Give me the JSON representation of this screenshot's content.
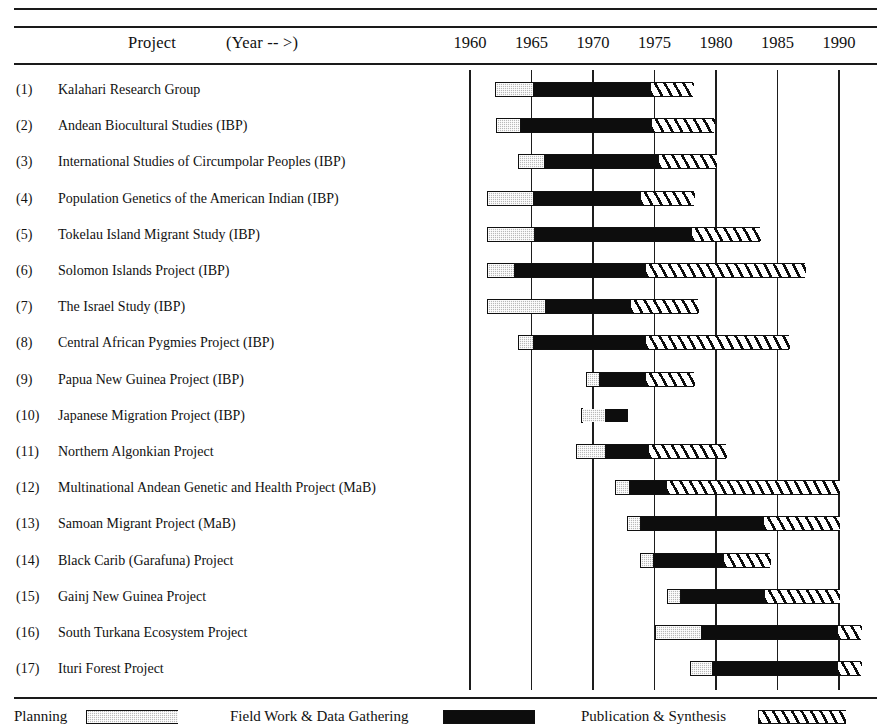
{
  "header": {
    "project_label": "Project",
    "year_label": "(Year -- >)",
    "year_ticks": [
      1960,
      1965,
      1970,
      1975,
      1980,
      1985,
      1990
    ]
  },
  "legend": {
    "items": [
      {
        "label": "Planning",
        "swatch": "planning",
        "color": "#b9b9b9"
      },
      {
        "label": "Field Work & Data Gathering",
        "swatch": "fieldwork",
        "color": "#0d0d0d"
      },
      {
        "label": "Publication & Synthesis",
        "swatch": "publication",
        "color": "#ffffff"
      }
    ]
  },
  "chart_data": {
    "type": "bar",
    "title": "",
    "xlabel": "(Year -- >)",
    "ylabel": "Project",
    "xlim": [
      1960,
      1993
    ],
    "grid": true,
    "xticks": [
      1960,
      1965,
      1970,
      1975,
      1980,
      1985,
      1990
    ],
    "legend_position": "bottom",
    "phases": [
      "Planning",
      "Field Work & Data Gathering",
      "Publication & Synthesis"
    ],
    "rows": [
      {
        "num": "(1)",
        "label": "Kalahari Research Group",
        "planning": [
          1962.0,
          1965.1
        ],
        "fieldwork": [
          1965.1,
          1974.6
        ],
        "publication": [
          1974.6,
          1978.1
        ]
      },
      {
        "num": "(2)",
        "label": "Andean Biocultural Studies (IBP)",
        "planning": [
          1962.1,
          1964.1
        ],
        "fieldwork": [
          1964.1,
          1974.7
        ],
        "publication": [
          1974.7,
          1979.8
        ]
      },
      {
        "num": "(3)",
        "label": "International Studies of Circumpolar Peoples (IBP)",
        "planning": [
          1963.9,
          1966.0
        ],
        "fieldwork": [
          1966.0,
          1975.3
        ],
        "publication": [
          1975.3,
          1980.0
        ]
      },
      {
        "num": "(4)",
        "label": "Population Genetics of the American Indian (IBP)",
        "planning": [
          1961.4,
          1965.1
        ],
        "fieldwork": [
          1965.1,
          1973.8
        ],
        "publication": [
          1973.8,
          1978.2
        ]
      },
      {
        "num": "(5)",
        "label": "Tokelau Island Migrant Study (IBP)",
        "planning": [
          1961.4,
          1965.2
        ],
        "fieldwork": [
          1965.2,
          1978.0
        ],
        "publication": [
          1978.0,
          1983.6
        ]
      },
      {
        "num": "(6)",
        "label": "Solomon Islands Project (IBP)",
        "planning": [
          1961.4,
          1963.6
        ],
        "fieldwork": [
          1963.6,
          1974.2
        ],
        "publication": [
          1974.2,
          1987.2
        ]
      },
      {
        "num": "(7)",
        "label": "The Israel Study (IBP)",
        "planning": [
          1961.4,
          1966.1
        ],
        "fieldwork": [
          1966.1,
          1973.0
        ],
        "publication": [
          1973.0,
          1978.5
        ]
      },
      {
        "num": "(8)",
        "label": "Central African Pygmies Project (IBP)",
        "planning": [
          1963.9,
          1965.1
        ],
        "fieldwork": [
          1965.1,
          1974.2
        ],
        "publication": [
          1974.2,
          1985.9
        ]
      },
      {
        "num": "(9)",
        "label": "Papua New Guinea Project (IBP)",
        "planning": [
          1969.4,
          1970.5
        ],
        "fieldwork": [
          1970.5,
          1974.2
        ],
        "publication": [
          1974.2,
          1978.2
        ]
      },
      {
        "num": "(10)",
        "label": "Japanese Migration Project (IBP)",
        "planning": [
          1969.0,
          1971.0
        ],
        "fieldwork": [
          1971.0,
          1972.8
        ],
        "publication": [
          1972.8,
          1076.0
        ]
      },
      {
        "num": "(11)",
        "label": "Northern Algonkian Project",
        "planning": [
          1968.6,
          1971.0
        ],
        "fieldwork": [
          1971.0,
          1974.5
        ],
        "publication": [
          1974.5,
          1980.8
        ]
      },
      {
        "num": "(12)",
        "label": "Multinational Andean Genetic and Health Project (MaB)",
        "planning": [
          1971.8,
          1972.9
        ],
        "fieldwork": [
          1972.9,
          1975.9
        ],
        "publication": [
          1975.9,
          1990.0
        ]
      },
      {
        "num": "(13)",
        "label": "Samoan Migrant Project (MaB)",
        "planning": [
          1972.8,
          1973.8
        ],
        "fieldwork": [
          1973.8,
          1983.8
        ],
        "publication": [
          1983.8,
          1990.0
        ]
      },
      {
        "num": "(14)",
        "label": "Black Carib (Garafuna) Project",
        "planning": [
          1973.8,
          1974.9
        ],
        "fieldwork": [
          1974.9,
          1980.6
        ],
        "publication": [
          1980.6,
          1984.4
        ]
      },
      {
        "num": "(15)",
        "label": "Gainj New Guinea Project",
        "planning": [
          1976.0,
          1977.1
        ],
        "fieldwork": [
          1977.1,
          1983.9
        ],
        "publication": [
          1983.9,
          1990.0
        ]
      },
      {
        "num": "(16)",
        "label": "South Turkana Ecosystem Project",
        "planning": [
          1975.0,
          1978.8
        ],
        "fieldwork": [
          1978.8,
          1989.8
        ],
        "publication": [
          1989.8,
          1991.8
        ]
      },
      {
        "num": "(17)",
        "label": "Ituri Forest Project",
        "planning": [
          1977.9,
          1979.7
        ],
        "fieldwork": [
          1979.7,
          1989.8
        ],
        "publication": [
          1989.8,
          1991.8
        ]
      }
    ]
  }
}
